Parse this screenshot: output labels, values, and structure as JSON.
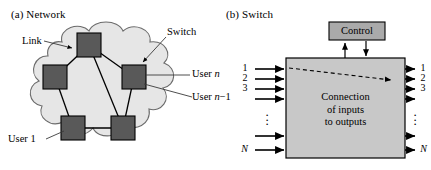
{
  "figure": {
    "width": 431,
    "height": 170,
    "background": "#ffffff",
    "colors": {
      "node_fill": "#595959",
      "node_stroke": "#000000",
      "cloud_fill": "#e6e6e6",
      "cloud_stroke": "#6b6b6b",
      "switch_fill": "#c8c8c8",
      "switch_stroke": "#000000",
      "control_fill": "#aaaaaa",
      "control_stroke": "#000000",
      "line": "#000000",
      "leader": "#3a3a3a",
      "text": "#000000"
    }
  },
  "panel_a": {
    "caption": "(a)  Network",
    "caption_letter": "(a)",
    "caption_title": "Network",
    "labels": {
      "link": "Link",
      "switch": "Switch",
      "user_n": "User n",
      "user_n_prefix": "User ",
      "user_n_italic": "n",
      "user_n_minus_1": "User n−1",
      "user_n_minus_1_suffix": "−1",
      "user_1": "User 1"
    },
    "nodes": [
      {
        "name": "node-top",
        "cx": 89,
        "cy": 45
      },
      {
        "name": "node-left",
        "cx": 55,
        "cy": 77
      },
      {
        "name": "node-right",
        "cx": 134,
        "cy": 77
      },
      {
        "name": "node-bottom-left",
        "cx": 73,
        "cy": 128
      },
      {
        "name": "node-bottom-right",
        "cx": 123,
        "cy": 128
      }
    ],
    "links": [
      [
        "node-top",
        "node-left"
      ],
      [
        "node-top",
        "node-right"
      ],
      [
        "node-top",
        "node-bottom-right"
      ],
      [
        "node-left",
        "node-bottom-left"
      ],
      [
        "node-right",
        "node-bottom-right"
      ],
      [
        "node-bottom-left",
        "node-bottom-right"
      ]
    ]
  },
  "panel_b": {
    "caption": "(b)  Switch",
    "caption_letter": "(b)",
    "caption_title": "Switch",
    "control": {
      "label": "Control"
    },
    "switch_box": {
      "line1": "Connection",
      "line2": "of inputs",
      "line3": "to outputs"
    },
    "inputs": {
      "labels": [
        "1",
        "2",
        "3",
        "",
        "",
        "N"
      ],
      "visible_numbers": [
        "1",
        "2",
        "3"
      ],
      "last_label": "N",
      "dots": "⋮"
    },
    "outputs": {
      "labels": [
        "1",
        "2",
        "3",
        "",
        "",
        "N"
      ],
      "visible_numbers": [
        "1",
        "2",
        "3"
      ],
      "last_label": "N",
      "dots": "⋮"
    },
    "connection_path": {
      "from_port": 1,
      "to_port": 2,
      "style": "dashed"
    }
  }
}
